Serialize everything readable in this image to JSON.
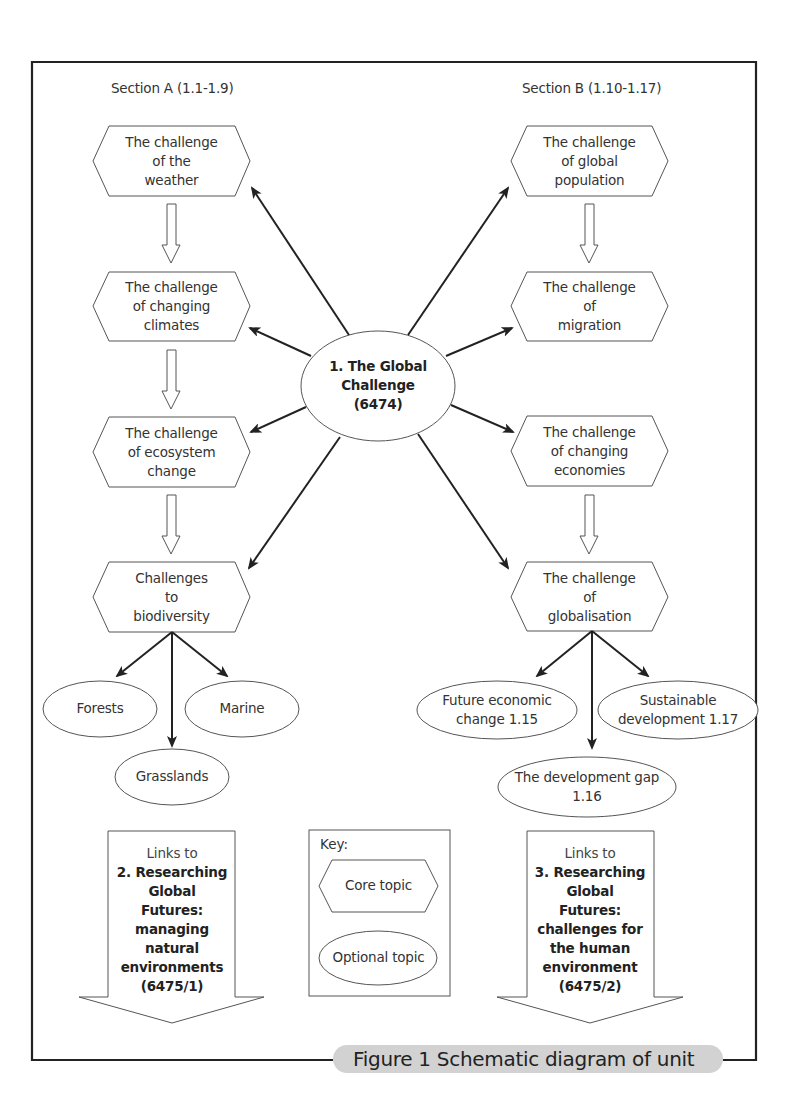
{
  "diagram": {
    "caption": "Figure 1 Schematic diagram of unit",
    "sections": {
      "a": {
        "label": "Section A (1.1-1.9)"
      },
      "b": {
        "label": "Section B (1.10-1.17)"
      }
    },
    "center": {
      "lines": [
        "1. The Global",
        "Challenge",
        "(6474)"
      ],
      "shape": "ellipse",
      "bold": true
    },
    "section_a_core_topics": [
      {
        "lines": [
          "The challenge",
          "of the",
          "weather"
        ]
      },
      {
        "lines": [
          "The challenge",
          "of changing",
          "climates"
        ]
      },
      {
        "lines": [
          "The challenge",
          "of ecosystem",
          "change"
        ]
      },
      {
        "lines": [
          "Challenges",
          "to",
          "biodiversity"
        ]
      }
    ],
    "section_b_core_topics": [
      {
        "lines": [
          "The challenge",
          "of global",
          "population"
        ]
      },
      {
        "lines": [
          "The challenge",
          "of",
          "migration"
        ]
      },
      {
        "lines": [
          "The challenge",
          "of changing",
          "economies"
        ]
      },
      {
        "lines": [
          "The challenge",
          "of",
          "globalisation"
        ]
      }
    ],
    "section_a_optional_topics": [
      {
        "lines": [
          "Forests"
        ]
      },
      {
        "lines": [
          "Marine"
        ]
      },
      {
        "lines": [
          "Grasslands"
        ]
      }
    ],
    "section_b_optional_topics": [
      {
        "lines": [
          "Future economic",
          "change 1.15"
        ]
      },
      {
        "lines": [
          "Sustainable",
          "development 1.17"
        ]
      },
      {
        "lines": [
          "The development gap",
          "1.16"
        ]
      }
    ],
    "links": {
      "left": {
        "title": "Links to",
        "lines": [
          "2. Researching",
          "Global",
          "Futures:",
          "managing",
          "natural",
          "environments",
          "(6475/1)"
        ]
      },
      "right": {
        "title": "Links to",
        "lines": [
          "3. Researching",
          "Global",
          "Futures:",
          "challenges for",
          "the human",
          "environment",
          "(6475/2)"
        ]
      }
    },
    "key": {
      "title": "Key:",
      "core_label": "Core topic",
      "optional_label": "Optional topic"
    },
    "colors": {
      "border": "#222222",
      "shape_stroke": "#555555",
      "caption_bg": "#d2d2d2",
      "text": "#333333"
    }
  }
}
